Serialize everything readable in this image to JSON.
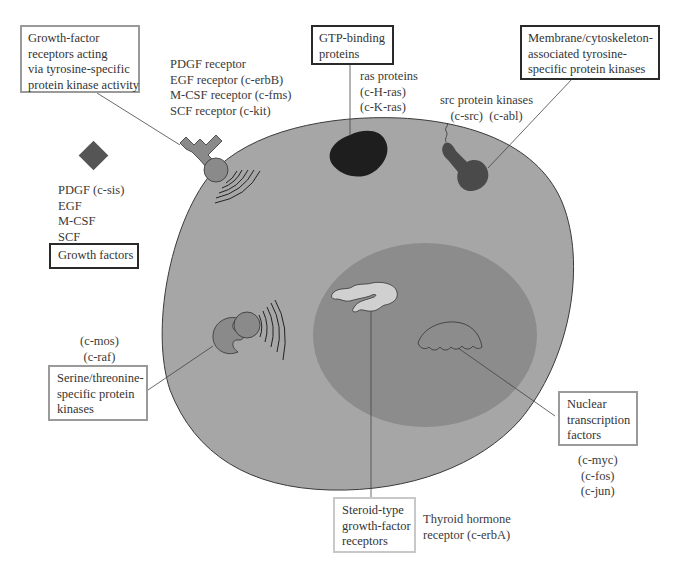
{
  "diagram": {
    "colors": {
      "cytoplasm": "#a6a6a6",
      "nucleus": "#8c8c8c",
      "ras_protein": "#1e1e1e",
      "src_kinase": "#4a4a4a",
      "receptor": "#8a8a8a",
      "growth_factor": "#555555",
      "steroid_receptor": "#d0d0d0"
    },
    "boxes": {
      "growth_factor_receptors": "Growth-factor\nreceptors acting\nvia tyrosine-specific\nprotein kinase activity",
      "gtp_binding": "GTP-binding\nproteins",
      "membrane_kinases": "Membrane/cytoskeleton-\nassociated tyrosine-\nspecific protein kinases",
      "growth_factors": "Growth factors",
      "serine_threonine": "Serine/threonine-\nspecific protein\nkinases",
      "nuclear_transcription": "Nuclear\ntranscription\nfactors",
      "steroid_receptors": "Steroid-type\ngrowth-factor\nreceptors"
    },
    "labels": {
      "receptor_list": "PDGF receptor\nEGF receptor (c-erbB)\nM-CSF receptor (c-fms)\nSCF receptor (c-kit)",
      "ras_list": "ras proteins\n(c-H-ras)\n(c-K-ras)",
      "src_list": "src protein kinases\n(c-src)  (c-abl)",
      "growth_factor_list": "PDGF (c-sis)\nEGF\nM-CSF\nSCF",
      "serine_list": "(c-mos)\n(c-raf)",
      "nuclear_list": "(c-myc)\n(c-fos)\n(c-jun)",
      "thyroid": "Thyroid hormone\nreceptor (c-erbA)"
    },
    "caption": "Figure: location of oncogene products within the cell (caption truncated)"
  }
}
